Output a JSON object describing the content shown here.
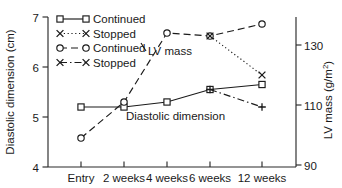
{
  "chart_data": {
    "type": "line",
    "title": "",
    "xlabel": "",
    "categories": [
      "Entry",
      "2 weeks",
      "4 weeks",
      "6 weeks",
      "12 weeks"
    ],
    "grid": false,
    "legend_position": "top-left",
    "axes": {
      "left": {
        "label": "Diastolic dimension (cm)",
        "ticks": [
          "4",
          "5",
          "6",
          "7"
        ],
        "tick_values": [
          4,
          5,
          6,
          7
        ],
        "lim": [
          4,
          7
        ]
      },
      "right": {
        "label": "LV mass (g/m2)",
        "label_display": "LV mass (g/m",
        "label_sup": "2",
        "label_tail": ")",
        "ticks": [
          "90",
          "110",
          "130"
        ],
        "tick_values": [
          90,
          110,
          130
        ],
        "lim": [
          90,
          137
        ]
      }
    },
    "annotations": [
      {
        "text": "LV mass",
        "x": 2.0,
        "y": 6.45
      },
      {
        "text": "Diastolic dimension",
        "x": 2.05,
        "y": 5.12
      }
    ],
    "series": [
      {
        "name": "Continued",
        "group": "Diastolic dimension",
        "axis": "left",
        "marker": "square-open",
        "linestyle": "solid",
        "x": [
          "Entry",
          "2 weeks",
          "4 weeks",
          "6 weeks",
          "12 weeks"
        ],
        "values": [
          5.2,
          5.2,
          5.3,
          5.55,
          5.65
        ]
      },
      {
        "name": "Stopped",
        "group": "Diastolic dimension",
        "axis": "left",
        "marker": "plus",
        "linestyle": "dashdot",
        "x": [
          "Entry",
          "2 weeks",
          "4 weeks",
          "6 weeks",
          "12 weeks"
        ],
        "values": [
          5.2,
          5.2,
          5.3,
          5.55,
          5.2
        ]
      },
      {
        "name": "Continued",
        "group": "LV mass",
        "axis": "right",
        "marker": "circle-open",
        "linestyle": "dashed",
        "x": [
          "Entry",
          "2 weeks",
          "4 weeks",
          "6 weeks",
          "12 weeks"
        ],
        "values": [
          99,
          111,
          134,
          133,
          137
        ]
      },
      {
        "name": "Stopped",
        "group": "LV mass",
        "axis": "right",
        "marker": "x",
        "linestyle": "dotted",
        "x": [
          "Entry",
          "2 weeks",
          "4 weeks",
          "6 weeks",
          "12 weeks"
        ],
        "values": [
          99,
          111,
          134,
          133,
          120
        ]
      }
    ]
  },
  "legend": {
    "items": [
      {
        "label": "Continued",
        "marker": "square-open",
        "linestyle": "solid"
      },
      {
        "label": "Stopped",
        "marker": "x",
        "linestyle": "dotted"
      },
      {
        "label": "Continued",
        "marker": "circle-open",
        "linestyle": "dashed"
      },
      {
        "label": "Stopped",
        "marker": "x",
        "linestyle": "dashdot"
      }
    ]
  },
  "colors": {
    "ink": "#1a1a1a",
    "axis": "#2b2b2b",
    "background": "#ffffff"
  }
}
